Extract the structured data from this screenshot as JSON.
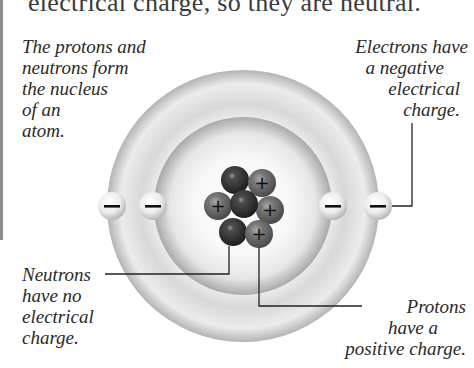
{
  "page": {
    "top_text": "electrical charge, so they are neutral."
  },
  "labels": {
    "nucleus": [
      "The protons and",
      "neutrons form",
      "the nucleus",
      "of an",
      "atom."
    ],
    "electrons": [
      "Electrons have",
      "a negative",
      "electrical",
      "charge."
    ],
    "neutrons": [
      "Neutrons",
      "have no",
      "electrical",
      "charge."
    ],
    "protons": [
      "Protons",
      "have a",
      "positive charge."
    ]
  },
  "atom": {
    "center": [
      243,
      206
    ],
    "outer_ring_radius": 136,
    "inner_ring_radius": 89,
    "electron_symbol": "−",
    "proton_symbol": "+",
    "electrons_count": 4,
    "protons_count": 4,
    "neutrons_count": 3
  },
  "colors": {
    "ring_light": "#f4f4f4",
    "ring_dark": "#a8a8a8",
    "neutron": "#3e3e3e",
    "proton": "#6a6a6a",
    "electron": "#f0f0f0",
    "leader_line": "#222222"
  }
}
